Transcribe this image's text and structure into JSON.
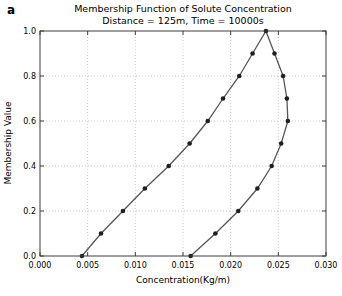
{
  "figure": {
    "panel_label": "a"
  },
  "chart_data": {
    "type": "line",
    "title": "Membership Function of Solute Concentration",
    "subtitle": "Distance = 125m, Time = 10000s",
    "xlabel": "Concentration(Kg/m)",
    "ylabel": "Membership Value",
    "xlim": [
      0.0,
      0.03
    ],
    "ylim": [
      0.0,
      1.0
    ],
    "xticks": [
      0.0,
      0.005,
      0.01,
      0.015,
      0.02,
      0.025,
      0.03
    ],
    "xtick_labels": [
      "0.000",
      "0.005",
      "0.010",
      "0.015",
      "0.020",
      "0.025",
      "0.030"
    ],
    "yticks": [
      0.0,
      0.2,
      0.4,
      0.6,
      0.8,
      1.0
    ],
    "ytick_labels": [
      "0.0",
      "0.2",
      "0.4",
      "0.6",
      "0.8",
      "1.0"
    ],
    "grid": true,
    "grid_style": "dotted",
    "legend_position": "none",
    "colors": {
      "line": "#575757",
      "marker": "#1f1f1f",
      "grid": "#bdbdbd",
      "spine": "#3d3d3d",
      "background": "#ffffff",
      "text": "#000000"
    },
    "series": [
      {
        "name": "membership-function",
        "marker": "circle",
        "points": [
          [
            0.0044,
            0.0
          ],
          [
            0.0064,
            0.1
          ],
          [
            0.0087,
            0.2
          ],
          [
            0.011,
            0.3
          ],
          [
            0.0135,
            0.4
          ],
          [
            0.0157,
            0.5
          ],
          [
            0.0176,
            0.6
          ],
          [
            0.0192,
            0.7
          ],
          [
            0.0209,
            0.8
          ],
          [
            0.0223,
            0.9
          ],
          [
            0.0237,
            1.0
          ],
          [
            0.0246,
            0.9
          ],
          [
            0.0255,
            0.8
          ],
          [
            0.0259,
            0.7
          ],
          [
            0.026,
            0.6
          ],
          [
            0.0253,
            0.5
          ],
          [
            0.0243,
            0.4
          ],
          [
            0.0228,
            0.3
          ],
          [
            0.0208,
            0.2
          ],
          [
            0.0184,
            0.1
          ],
          [
            0.0158,
            0.0
          ]
        ]
      }
    ]
  }
}
